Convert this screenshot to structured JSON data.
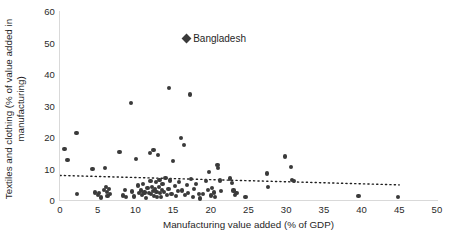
{
  "chart_data": {
    "type": "scatter",
    "title": "",
    "xlabel": "Manufacturing value added (% of GDP)",
    "ylabel": "Textiles and clothing (% of value added in manufacturing)",
    "xlim": [
      0,
      50
    ],
    "ylim": [
      0,
      60
    ],
    "xticks": [
      "0",
      "5",
      "10",
      "15",
      "20",
      "25",
      "30",
      "35",
      "40",
      "45",
      "50"
    ],
    "yticks": [
      "0",
      "10",
      "20",
      "30",
      "40",
      "50",
      "60"
    ],
    "grid": false,
    "legend_position": "inside-top-center",
    "marker_color": "#3a3a3a",
    "axis_color": "#d9d9d9",
    "annotations": [
      {
        "label": "Bangladesh",
        "marker": "diamond",
        "x": 17.0,
        "y": 51.0
      }
    ],
    "trendline": {
      "style": "dotted",
      "color": "#1f1f1f",
      "x_start": 0.0,
      "y_start": 7.8,
      "x_end": 45.0,
      "y_end": 4.8
    },
    "points": [
      [
        0.6,
        16.2
      ],
      [
        1.0,
        12.8
      ],
      [
        2.2,
        21.2
      ],
      [
        2.3,
        2.0
      ],
      [
        4.3,
        9.8
      ],
      [
        4.6,
        2.4
      ],
      [
        5.0,
        1.6
      ],
      [
        5.2,
        2.2
      ],
      [
        5.4,
        0.8
      ],
      [
        5.8,
        3.2
      ],
      [
        6.0,
        10.2
      ],
      [
        6.1,
        4.0
      ],
      [
        6.2,
        2.6
      ],
      [
        6.3,
        1.2
      ],
      [
        6.5,
        3.6
      ],
      [
        6.6,
        2.0
      ],
      [
        7.9,
        15.3
      ],
      [
        8.4,
        1.4
      ],
      [
        8.6,
        3.3
      ],
      [
        8.8,
        0.9
      ],
      [
        9.4,
        30.7
      ],
      [
        9.6,
        2.7
      ],
      [
        9.8,
        1.1
      ],
      [
        10.1,
        13.0
      ],
      [
        10.3,
        4.6
      ],
      [
        10.5,
        2.1
      ],
      [
        10.7,
        3.0
      ],
      [
        10.9,
        1.5
      ],
      [
        11.0,
        5.2
      ],
      [
        11.2,
        2.4
      ],
      [
        11.4,
        0.6
      ],
      [
        11.6,
        3.8
      ],
      [
        11.8,
        2.2
      ],
      [
        11.9,
        14.9
      ],
      [
        12.0,
        6.0
      ],
      [
        12.1,
        1.8
      ],
      [
        12.2,
        4.2
      ],
      [
        12.3,
        2.9
      ],
      [
        12.4,
        16.0
      ],
      [
        12.5,
        1.3
      ],
      [
        12.6,
        3.4
      ],
      [
        12.7,
        5.6
      ],
      [
        12.8,
        2.6
      ],
      [
        12.9,
        0.9
      ],
      [
        13.0,
        14.2
      ],
      [
        13.1,
        4.0
      ],
      [
        13.2,
        6.4
      ],
      [
        13.3,
        2.2
      ],
      [
        13.4,
        1.0
      ],
      [
        13.5,
        3.1
      ],
      [
        13.6,
        5.0
      ],
      [
        13.8,
        2.5
      ],
      [
        14.0,
        7.0
      ],
      [
        14.2,
        1.7
      ],
      [
        14.4,
        3.6
      ],
      [
        14.5,
        35.6
      ],
      [
        14.6,
        6.2
      ],
      [
        14.8,
        2.0
      ],
      [
        15.0,
        12.4
      ],
      [
        15.2,
        4.4
      ],
      [
        15.4,
        1.2
      ],
      [
        15.6,
        2.8
      ],
      [
        15.8,
        5.8
      ],
      [
        16.0,
        19.7
      ],
      [
        16.2,
        3.0
      ],
      [
        16.4,
        17.4
      ],
      [
        16.6,
        1.5
      ],
      [
        16.8,
        4.8
      ],
      [
        17.0,
        2.3
      ],
      [
        17.2,
        33.5
      ],
      [
        17.4,
        6.6
      ],
      [
        17.6,
        1.0
      ],
      [
        17.8,
        3.4
      ],
      [
        18.0,
        5.2
      ],
      [
        18.4,
        2.0
      ],
      [
        18.6,
        0.5
      ],
      [
        19.0,
        1.8
      ],
      [
        19.4,
        6.0
      ],
      [
        19.6,
        3.2
      ],
      [
        19.8,
        9.0
      ],
      [
        20.0,
        1.4
      ],
      [
        20.2,
        3.8
      ],
      [
        20.4,
        2.4
      ],
      [
        20.6,
        1.0
      ],
      [
        20.9,
        11.0
      ],
      [
        21.0,
        10.2
      ],
      [
        21.2,
        6.2
      ],
      [
        21.4,
        2.8
      ],
      [
        22.6,
        6.8
      ],
      [
        22.8,
        5.4
      ],
      [
        23.0,
        3.0
      ],
      [
        23.2,
        1.6
      ],
      [
        23.4,
        2.2
      ],
      [
        24.6,
        0.9
      ],
      [
        27.4,
        8.4
      ],
      [
        27.6,
        4.2
      ],
      [
        29.8,
        13.8
      ],
      [
        30.6,
        10.6
      ],
      [
        30.8,
        6.4
      ],
      [
        31.0,
        6.0
      ],
      [
        39.6,
        1.2
      ],
      [
        44.8,
        1.0
      ]
    ]
  }
}
